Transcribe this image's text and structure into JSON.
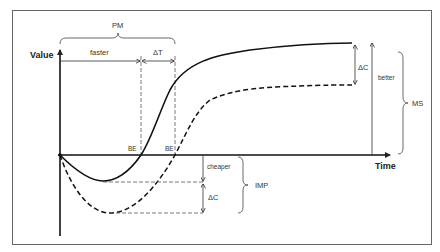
{
  "diagram": {
    "axes": {
      "y_label": "Value",
      "x_label": "Time"
    },
    "top_annotations": {
      "brace_label": "PM",
      "faster_label": "faster",
      "delta_t_label": "ΔT"
    },
    "break_even": {
      "solid_label": "BE",
      "dashed_label": "BE"
    },
    "right_annotations": {
      "delta_c_label": "ΔC",
      "better_label": "better",
      "brace_label": "MS"
    },
    "bottom_annotations": {
      "cheaper_label": "cheaper",
      "delta_c_label": "ΔC",
      "brace_label": "IMP"
    },
    "series": [
      {
        "name": "solid-curve",
        "style": "solid"
      },
      {
        "name": "dashed-curve",
        "style": "dashed"
      }
    ],
    "colors": {
      "line": "#111111",
      "thin_line": "#444444",
      "frame": "#555555",
      "text": "#333333"
    }
  }
}
